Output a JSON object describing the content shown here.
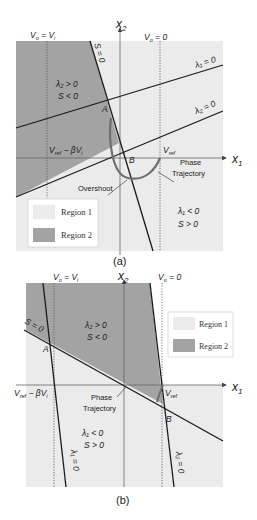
{
  "panel_a": {
    "caption": "(a)",
    "axis_x": "x",
    "axis_x_sub": "1",
    "axis_y": "x",
    "axis_y_sub": "2",
    "vo_vi": "V",
    "vo_vi_sub": "o",
    "vo_vi_eq": " = V",
    "vo_vi_sub2": "i",
    "vo_zero": "V",
    "vo_zero_sub": "o",
    "vo_zero_eq": " = 0",
    "s_line": "S = 0",
    "lambda1_line": "λ₁ = 0",
    "lambda2_line": "λ₂ = 0",
    "region2_cond1": "λ₂ > 0",
    "region2_cond2": "S < 0",
    "region1_cond1": "λ₁ < 0",
    "region1_cond2": "S > 0",
    "point_a": "A",
    "point_b": "B",
    "vref_beta": "V",
    "vref_beta_sub": "ref",
    "vref_beta_rest": " − βV",
    "vref_beta_sub2": "i",
    "vref": "V",
    "vref_sub": "ref",
    "phase_1": "Phase",
    "phase_2": "Trajectory",
    "overshoot": "Overshoot",
    "legend": {
      "region1": "Region 1",
      "region2": "Region 2"
    }
  },
  "panel_b": {
    "caption": "(b)",
    "axis_x": "x",
    "axis_x_sub": "1",
    "axis_y": "x",
    "axis_y_sub": "2",
    "vo_vi": "V",
    "vo_vi_sub": "o",
    "vo_vi_eq": " = V",
    "vo_vi_sub2": "i",
    "vo_zero": "V",
    "vo_zero_sub": "o",
    "vo_zero_eq": " = 0",
    "s_line": "S = 0",
    "lambda1_line": "λ₁ = 0",
    "lambda2_line": "λ₂ = 0",
    "region2_cond1": "λ₂ > 0",
    "region2_cond2": "S < 0",
    "region1_cond1": "λ₁ < 0",
    "region1_cond2": "S > 0",
    "point_a": "A",
    "point_b": "B",
    "vref_beta": "V",
    "vref_beta_sub": "ref",
    "vref_beta_rest": " − βV",
    "vref_beta_sub2": "i",
    "vref": "V",
    "vref_sub": "ref",
    "phase_1": "Phase",
    "phase_2": "Trajectory",
    "legend": {
      "region1": "Region 1",
      "region2": "Region 2"
    }
  },
  "colors": {
    "region1": "#ebebeb",
    "region2": "#a3a3a3",
    "line": "#1a1a1a",
    "trajectory": "#6e6e6e"
  }
}
